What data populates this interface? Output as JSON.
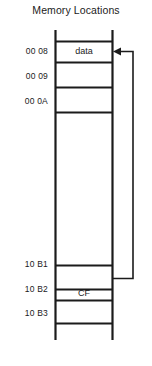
{
  "diagram": {
    "title": "Memory Locations",
    "type": "memory-map",
    "colors": {
      "stroke": "#1b1b1b",
      "text": "#1b1b1b",
      "background": "#ffffff"
    },
    "table": {
      "left_x": 55,
      "right_x": 113,
      "top_stub_y": 30,
      "bottom_stub_y": 340
    },
    "rows": [
      {
        "address": "00 08",
        "value": "data",
        "label_y": 46,
        "line_top": 41,
        "line_bottom": 62,
        "has_arrow_target": true
      },
      {
        "address": "00 09",
        "value": "",
        "label_y": 71,
        "line_top": 62,
        "line_bottom": 87,
        "has_arrow_target": false
      },
      {
        "address": "00 0A",
        "value": "",
        "label_y": 96,
        "line_top": 87,
        "line_bottom": 112,
        "has_arrow_target": false
      },
      {
        "address": "",
        "value": "",
        "label_y": 0,
        "line_top": 112,
        "line_bottom": 265,
        "has_arrow_target": false
      },
      {
        "address": "10 B1",
        "value": "",
        "label_y": 259,
        "line_top": 265,
        "line_bottom": 289,
        "has_arrow_target": false
      },
      {
        "address": "10 B2",
        "value": "CF",
        "label_y": 284,
        "line_top": 289,
        "line_bottom": 300,
        "has_arrow_target": false,
        "is_source": true
      },
      {
        "address": "10 B3",
        "value": "",
        "label_y": 308,
        "line_top": 300,
        "line_bottom": 323,
        "has_arrow_target": false
      }
    ],
    "pointer": {
      "from_row_address": "10 B2",
      "to_row_address": "00 08",
      "from_value": "CF",
      "to_value": "data",
      "arrow_tip_x": 114,
      "arrow_y": 51,
      "elbow_x": 133,
      "source_y": 278,
      "description": "pointer from CF at 10 B2 to data at 00 08"
    },
    "horizontal_lines_y": [
      41,
      62,
      87,
      112,
      265,
      289,
      300,
      323
    ],
    "address_labels": [
      "00 08",
      "00 09",
      "00 0A",
      "10 B1",
      "10 B2",
      "10 B3"
    ],
    "cell_values": [
      "data",
      "CF"
    ]
  }
}
